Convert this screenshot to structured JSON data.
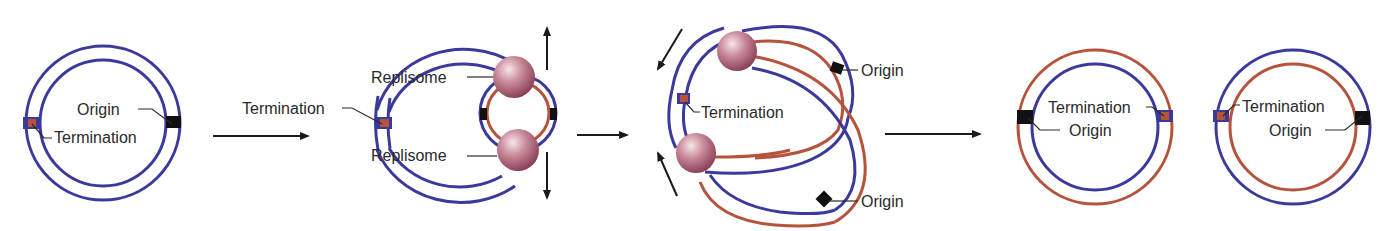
{
  "colors": {
    "parental_strand": "#3b3a9c",
    "daughter_strand": "#b5533c",
    "origin_marker": "#111111",
    "termination_marker": "#b5533c",
    "replisome": "#b86a80",
    "arrow": "#1a1a1a",
    "text": "#2a2a2a"
  },
  "stages": [
    {
      "name": "parental-circle",
      "labels": {
        "origin": "Origin",
        "termination": "Termination"
      }
    },
    {
      "name": "theta-replication",
      "labels": {
        "termination": "Termination",
        "replisome_top": "Replisome",
        "replisome_bottom": "Replisome"
      }
    },
    {
      "name": "late-replication",
      "labels": {
        "termination": "Termination",
        "origin_top": "Origin",
        "origin_bottom": "Origin"
      }
    },
    {
      "name": "daughter-circle-1",
      "labels": {
        "termination": "Termination",
        "origin": "Origin"
      }
    },
    {
      "name": "daughter-circle-2",
      "labels": {
        "termination": "Termination",
        "origin": "Origin"
      }
    }
  ]
}
